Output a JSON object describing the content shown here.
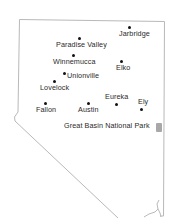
{
  "map": {
    "region": "Nevada",
    "border_color": "#b9b9b9",
    "park_color": "#a8a8a8",
    "cities": [
      {
        "name": "Jarbridge",
        "dot": [
          129,
          27
        ],
        "label": [
          119,
          30
        ]
      },
      {
        "name": "Paradise Valley",
        "dot": [
          79,
          38
        ],
        "label": [
          56,
          41
        ]
      },
      {
        "name": "Winnemucca",
        "dot": [
          73,
          55
        ],
        "label": [
          53,
          58
        ]
      },
      {
        "name": "Elko",
        "dot": [
          121,
          61
        ],
        "label": [
          116,
          64
        ]
      },
      {
        "name": "Unionville",
        "dot": [
          64,
          73
        ],
        "label": [
          67,
          72
        ]
      },
      {
        "name": "Lovelock",
        "dot": [
          54,
          81
        ],
        "label": [
          40,
          84
        ]
      },
      {
        "name": "Eureka",
        "dot": [
          116,
          104
        ],
        "label": [
          105,
          93
        ]
      },
      {
        "name": "Ely",
        "dot": [
          141,
          109
        ],
        "label": [
          138,
          98
        ]
      },
      {
        "name": "Fallon",
        "dot": [
          45,
          103
        ],
        "label": [
          36,
          106
        ]
      },
      {
        "name": "Austin",
        "dot": [
          88,
          103
        ],
        "label": [
          78,
          106
        ]
      }
    ],
    "park": {
      "name": "Great Basin National Park",
      "label": [
        64,
        122
      ],
      "icon": [
        156,
        123
      ]
    }
  }
}
